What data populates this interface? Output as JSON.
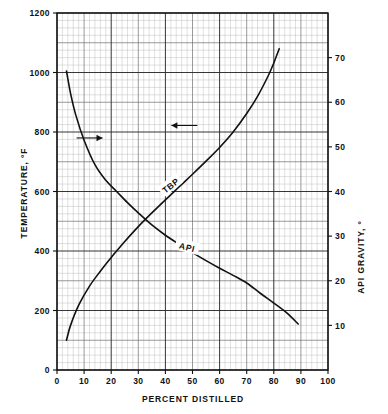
{
  "chart_data": {
    "type": "line",
    "title": "",
    "xlabel": "PERCENT DISTILLED",
    "ylabel": "TEMPERATURE, °F",
    "y2label": "API GRAVITY, °",
    "xlim": [
      0,
      100
    ],
    "ylim": [
      0,
      1200
    ],
    "y2lim": [
      0,
      80
    ],
    "grid": true,
    "grid_minor_step_x": 2,
    "grid_minor_step_y": 25,
    "grid_major_step_x": 10,
    "grid_major_step_y": 200,
    "legend": "none",
    "xticks": [
      0,
      10,
      20,
      30,
      40,
      50,
      60,
      70,
      80,
      90,
      100
    ],
    "xticklabels": [
      "0",
      "10",
      "20",
      "30",
      "40",
      "50",
      "60",
      "70",
      "80",
      "90",
      "100"
    ],
    "yticks": [
      0,
      200,
      400,
      600,
      800,
      1000,
      1200
    ],
    "yticklabels": [
      "0",
      "200",
      "400",
      "600",
      "800",
      "1000",
      "1200"
    ],
    "y2ticks": [
      10,
      20,
      30,
      40,
      50,
      60,
      70
    ],
    "y2ticklabels": [
      "10",
      "20",
      "30",
      "40",
      "50",
      "60",
      "70"
    ],
    "series": [
      {
        "name": "TBP",
        "label": "TBP",
        "axis": "left",
        "units": "°F",
        "x": [
          3.5,
          5,
          8,
          12,
          16,
          20,
          22,
          25,
          30,
          35,
          40,
          45,
          50,
          55,
          60,
          65,
          70,
          74,
          78,
          80,
          82
        ],
        "values": [
          100,
          150,
          218,
          282,
          332,
          378,
          400,
          432,
          482,
          528,
          572,
          615,
          658,
          702,
          748,
          800,
          862,
          920,
          990,
          1032,
          1080
        ]
      },
      {
        "name": "API",
        "label": "API",
        "axis": "right",
        "units": "°",
        "x": [
          3.5,
          5,
          7,
          10,
          14,
          18,
          22,
          26,
          30,
          35,
          40,
          45,
          50,
          55,
          60,
          65,
          70,
          75,
          80,
          85,
          89
        ],
        "values": [
          67,
          62,
          57,
          51.5,
          46,
          42.5,
          40,
          37.5,
          35.2,
          32.5,
          30.2,
          28.2,
          26.3,
          24.5,
          22.8,
          21.2,
          19.5,
          17.2,
          15.0,
          12.7,
          10.3
        ]
      }
    ],
    "annotations": [
      {
        "name": "tbp-arrow",
        "text": "",
        "direction": "left",
        "meaning": "TBP curve reads on left temperature axis",
        "x": 47,
        "y": 822
      },
      {
        "name": "api-arrow",
        "text": "",
        "direction": "right",
        "meaning": "API curve reads on right API gravity axis",
        "x": 12,
        "y": 525
      },
      {
        "name": "tbp-curve-label",
        "text": "TBP",
        "x": 42,
        "y": 630,
        "rotation": -38
      },
      {
        "name": "api-curve-label",
        "text": "API",
        "x": 48,
        "y": 282,
        "rotation": 14
      }
    ]
  }
}
